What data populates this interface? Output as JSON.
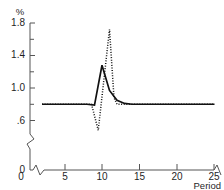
{
  "chart_data": {
    "type": "line",
    "title": "",
    "xlabel": "Period",
    "ylabel": "%",
    "xlim": [
      0,
      25
    ],
    "ylim": [
      0.4,
      1.8
    ],
    "grid": false,
    "legend": "none",
    "axis_break_y": true,
    "axis_break_x": true,
    "x_ticks": [
      0,
      5,
      10,
      15,
      20,
      25
    ],
    "x_tick_labels": [
      "0",
      "5",
      "10",
      "15",
      "20",
      "25"
    ],
    "y_ticks": [
      0.6,
      1.0,
      1.4,
      1.8
    ],
    "y_tick_labels": [
      ".6",
      "1.0",
      "1.4",
      "1.8"
    ],
    "y_origin_label": "0",
    "y_minor_ticks": [
      0.8,
      1.2,
      1.6
    ],
    "series": [
      {
        "name": "solid",
        "style": "solid",
        "x": [
          2,
          3,
          4,
          5,
          6,
          7,
          8,
          9,
          10,
          11,
          12,
          13,
          14,
          15,
          16,
          17,
          18,
          19,
          20,
          21,
          22,
          23,
          24,
          25
        ],
        "values": [
          0.8,
          0.8,
          0.8,
          0.8,
          0.8,
          0.8,
          0.8,
          0.79,
          1.28,
          0.97,
          0.85,
          0.81,
          0.8,
          0.8,
          0.8,
          0.8,
          0.8,
          0.8,
          0.8,
          0.8,
          0.8,
          0.8,
          0.8,
          0.8
        ]
      },
      {
        "name": "dotted",
        "style": "dotted",
        "x": [
          2,
          3,
          4,
          5,
          6,
          7,
          8,
          8.6,
          9.5,
          11,
          11.6,
          12,
          13,
          14,
          15,
          16,
          17,
          18,
          19,
          20,
          21,
          22,
          23,
          24,
          25
        ],
        "values": [
          0.8,
          0.8,
          0.8,
          0.8,
          0.8,
          0.8,
          0.8,
          0.8,
          0.48,
          1.72,
          0.88,
          0.8,
          0.8,
          0.8,
          0.8,
          0.8,
          0.8,
          0.8,
          0.8,
          0.8,
          0.8,
          0.8,
          0.8,
          0.8,
          0.8
        ]
      }
    ]
  }
}
